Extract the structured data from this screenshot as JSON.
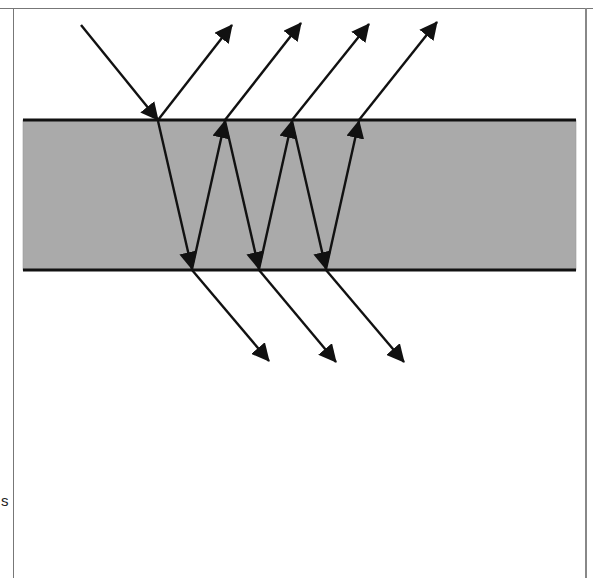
{
  "diagram": {
    "title": "",
    "colors": {
      "background": "#ffffff",
      "slab_fill": "#aaaaaa",
      "slab_edge": "#111111",
      "ray": "#111111",
      "frame": "#777777"
    },
    "slab": {
      "x": 23,
      "y": 120,
      "width": 553,
      "height": 150
    },
    "incident_ray": {
      "from": [
        81,
        25
      ],
      "to": [
        158,
        120
      ]
    },
    "top_points": [
      158,
      225,
      292,
      359
    ],
    "bottom_points": [
      192,
      259,
      326
    ],
    "reflected_tips": [
      [
        232,
        25
      ],
      [
        301,
        23
      ],
      [
        369,
        24
      ],
      [
        437,
        22
      ]
    ],
    "transmitted_tips": [
      [
        269,
        361
      ],
      [
        336,
        362
      ],
      [
        404,
        362
      ]
    ],
    "cut_off_text": "s"
  }
}
